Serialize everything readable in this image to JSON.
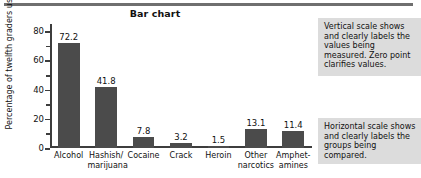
{
  "chart_data": {
    "type": "bar",
    "title": "Bar chart",
    "xlabel": "",
    "ylabel": "Percentage of twelfth graders using",
    "categories": [
      "Alcohol",
      "Hashish/ marijuana",
      "Cocaine",
      "Crack",
      "Heroin",
      "Other narcotics",
      "Amphet- amines"
    ],
    "category_lines": [
      [
        "Alcohol"
      ],
      [
        "Hashish/",
        "marijuana"
      ],
      [
        "Cocaine"
      ],
      [
        "Crack"
      ],
      [
        "Heroin"
      ],
      [
        "Other",
        "narcotics"
      ],
      [
        "Amphet-",
        "amines"
      ]
    ],
    "values": [
      72.2,
      41.8,
      7.8,
      3.2,
      1.5,
      13.1,
      11.4
    ],
    "value_labels": [
      "72.2",
      "41.8",
      "7.8",
      "3.2",
      "1.5",
      "13.1",
      "11.4"
    ],
    "ylim": [
      0,
      85
    ],
    "yticks": [
      0,
      20,
      40,
      60,
      80
    ],
    "ytick_labels": [
      "0",
      "20",
      "40",
      "60",
      "80"
    ],
    "yminor_ticks": [
      10,
      30,
      50,
      70
    ],
    "grid": false,
    "legend": false,
    "bar_color": "#4b4b4b",
    "axis_color": "#3d3d3d"
  },
  "annotations": {
    "vertical": "Vertical scale shows and clearly labels the values being measured. Zero point clarifies values.",
    "horizontal": "Horizontal scale shows and clearly labels the groups being compared.",
    "box_color": "#dcdcdc"
  },
  "rule": {
    "color": "#6f6f6f"
  }
}
